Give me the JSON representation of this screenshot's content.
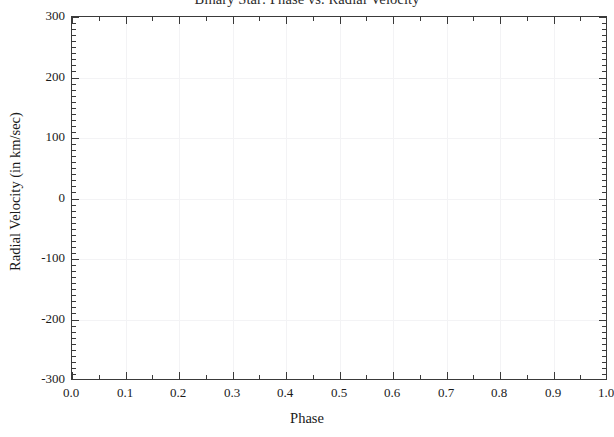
{
  "figure": {
    "background_color": "#ffffff",
    "frame_color": "#3a3a3a",
    "grid_color": "#f3f3f5",
    "text_color": "#1a1a1a"
  },
  "chart_data": {
    "type": "scatter",
    "title": "Binary Star: Phase vs. Radial Velocity",
    "xlabel": "Phase",
    "ylabel": "Radial Velocity (in km/sec)",
    "xlim": [
      0.0,
      1.0
    ],
    "ylim": [
      -300,
      300
    ],
    "xticks": [
      0.0,
      0.1,
      0.2,
      0.3,
      0.4,
      0.5,
      0.6,
      0.7,
      0.8,
      0.9,
      1.0
    ],
    "xtick_labels": [
      "0.0",
      "0.1",
      "0.2",
      "0.3",
      "0.4",
      "0.5",
      "0.6",
      "0.7",
      "0.8",
      "0.9",
      "1.0"
    ],
    "yticks": [
      300,
      200,
      100,
      0,
      -100,
      -200,
      -300
    ],
    "ytick_labels": [
      "300",
      "200",
      "100",
      "0",
      "-100",
      "-200",
      "-300"
    ],
    "x_minor_tick_interval": 0.05,
    "y_minor_tick_interval": 10,
    "grid": true,
    "grid_visibility": "very-faint",
    "legend": null,
    "series": [
      {
        "name": "radial-velocity",
        "x": [],
        "y": [],
        "note": "plot area is empty - no data points rendered"
      }
    ]
  }
}
